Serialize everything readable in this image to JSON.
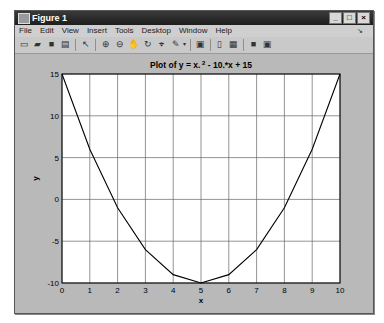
{
  "window": {
    "title": "Figure 1",
    "controls": {
      "minimize": "_",
      "maximize": "□",
      "close": "×"
    }
  },
  "menubar": {
    "items": [
      "File",
      "Edit",
      "View",
      "Insert",
      "Tools",
      "Desktop",
      "Window",
      "Help"
    ],
    "dock_glyph": "↘"
  },
  "toolbar": {
    "buttons": [
      "new-figure",
      "open-file",
      "save",
      "print",
      "edit-plot",
      "zoom-in",
      "zoom-out",
      "pan",
      "rotate-3d",
      "data-cursor",
      "brush",
      "link-plot",
      "colorbar",
      "legend",
      "hide-plot-tools",
      "show-plot-tools"
    ]
  },
  "chart_data": {
    "type": "line",
    "title_parts": {
      "pre": "Plot of y = x.",
      "sup": "2",
      "post": " - 10.*x + 15"
    },
    "xlabel": "x",
    "ylabel": "y",
    "xlim": [
      0,
      10
    ],
    "ylim": [
      -10,
      15
    ],
    "xticks": [
      0,
      1,
      2,
      3,
      4,
      5,
      6,
      7,
      8,
      9,
      10
    ],
    "yticks": [
      -10,
      -5,
      0,
      5,
      10,
      15
    ],
    "grid": true,
    "x": [
      0,
      1,
      2,
      3,
      4,
      5,
      6,
      7,
      8,
      9,
      10
    ],
    "y": [
      15,
      6,
      -1,
      -6,
      -9,
      -10,
      -9,
      -6,
      -1,
      6,
      15
    ],
    "line_color": "#000000"
  }
}
